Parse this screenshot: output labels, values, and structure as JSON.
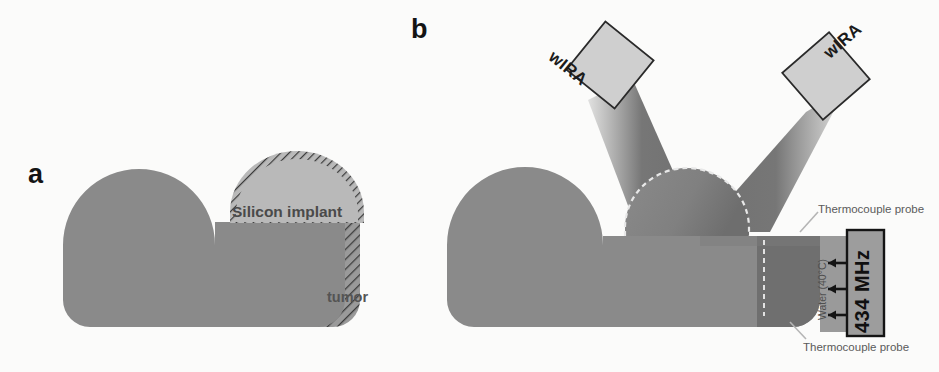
{
  "figure": {
    "panels": [
      {
        "id": "a",
        "label": "a"
      },
      {
        "id": "b",
        "label": "b"
      }
    ]
  },
  "panel_a": {
    "label": "a",
    "implant_label": "Silicon implant",
    "tumor_label": "tumor"
  },
  "panel_b": {
    "label": "b",
    "emitter_left_label": "wIRA",
    "emitter_right_label": "wIRA",
    "applicator_label": "434 MHz",
    "water_label": "Water (40°C)",
    "thermocouple_top_label": "Thermocouple probe",
    "thermocouple_bottom_label": "Thermocouple probe"
  },
  "colors": {
    "background": "#fbfbfa",
    "tissue": "#8a8a8a",
    "tissue_shadow": "#6f6f6f",
    "implant_fill": "#b9b9b9",
    "implant_edge": "#6a6a6a",
    "beam": "#6d6d6d",
    "emitter_face": "#cfcfcf",
    "applicator_fill": "#9a9a9a",
    "applicator_border": "#1a1a1a",
    "label_dark": "#141414",
    "label_gray": "#5a5a5a"
  }
}
